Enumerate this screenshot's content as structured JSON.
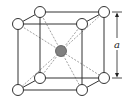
{
  "diagram": {
    "type": "body-centered-cubic-unit-cell",
    "dimension_label": "a",
    "colors": {
      "edge": "#333333",
      "diagonal": "#888888",
      "corner_atom_fill": "#ffffff",
      "corner_atom_stroke": "#333333",
      "center_atom_fill": "#808080",
      "center_atom_stroke": "#555555",
      "arrow": "#222222"
    },
    "corner_atoms": [
      {
        "id": "back-top-left",
        "x": 40,
        "y": 12
      },
      {
        "id": "back-top-right",
        "x": 104,
        "y": 12
      },
      {
        "id": "front-top-left",
        "x": 18,
        "y": 24
      },
      {
        "id": "front-top-right",
        "x": 82,
        "y": 24
      },
      {
        "id": "back-bottom-left",
        "x": 40,
        "y": 78
      },
      {
        "id": "back-bottom-right",
        "x": 104,
        "y": 78
      },
      {
        "id": "front-bottom-left",
        "x": 18,
        "y": 90
      },
      {
        "id": "front-bottom-right",
        "x": 82,
        "y": 90
      }
    ],
    "center_atom": {
      "id": "body-center",
      "x": 61,
      "y": 51
    },
    "atom_radius": 5.5
  }
}
